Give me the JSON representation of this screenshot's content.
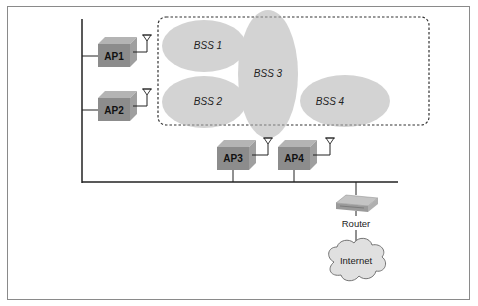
{
  "diagram": {
    "type": "wireless-network-ess",
    "access_points": [
      {
        "id": "ap1",
        "label": "AP1"
      },
      {
        "id": "ap2",
        "label": "AP2"
      },
      {
        "id": "ap3",
        "label": "AP3"
      },
      {
        "id": "ap4",
        "label": "AP4"
      }
    ],
    "bss": [
      {
        "id": "bss1",
        "label": "BSS 1"
      },
      {
        "id": "bss2",
        "label": "BSS 2"
      },
      {
        "id": "bss3",
        "label": "BSS 3"
      },
      {
        "id": "bss4",
        "label": "BSS 4"
      }
    ],
    "router": {
      "label": "Router"
    },
    "internet": {
      "label": "Internet"
    },
    "colors": {
      "bss_fill": "#c9c9c9",
      "ap_front": "#8c8c8c",
      "ap_top": "#b4b4b4",
      "ap_side": "#9f9f9f",
      "line": "#222222",
      "cloud_fill": "#e0e0e0"
    }
  }
}
